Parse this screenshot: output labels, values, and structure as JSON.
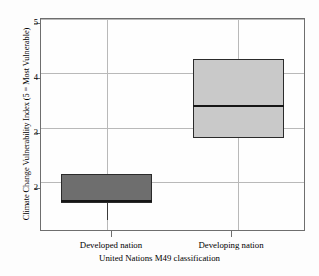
{
  "chart_data": {
    "type": "box",
    "title": "",
    "xlabel": "United Nations M49 classification",
    "ylabel": "Climate Change Vulnerability Index (5 = Most Vulnerable)",
    "categories": [
      "Developed nation",
      "Developing nation"
    ],
    "ylim": [
      1.12,
      5.0
    ],
    "yticks": [
      2,
      3,
      4,
      5
    ],
    "ytick_labels": [
      "2",
      "3",
      "4",
      "5"
    ],
    "grid": true,
    "legend": "none",
    "boxes": [
      {
        "category": "Developed nation",
        "q3": 2.15,
        "median": 1.66,
        "q1": 1.62,
        "whisker_low": 1.3,
        "whisker_high": 2.15,
        "fill": "#6e6e6e"
      },
      {
        "category": "Developing nation",
        "q3": 4.27,
        "median": 3.4,
        "q1": 2.82,
        "whisker_low": 2.82,
        "whisker_high": 4.27,
        "fill": "#c9c9c9"
      }
    ]
  },
  "axis": {
    "y_title": "Climate Change Vulnerability Index (5 = Most Vulnerable)",
    "x_title": "United Nations M49 classification",
    "ytick_2": "2",
    "ytick_3": "3",
    "ytick_4": "4",
    "ytick_5": "5",
    "xtick_1": "Developed nation",
    "xtick_2": "Developing nation"
  },
  "colors": {
    "box1_fill": "#6e6e6e",
    "box2_fill": "#c9c9c9",
    "frame": "#6e6e6e",
    "grid": "#b9b9b9",
    "median": "#161616"
  }
}
